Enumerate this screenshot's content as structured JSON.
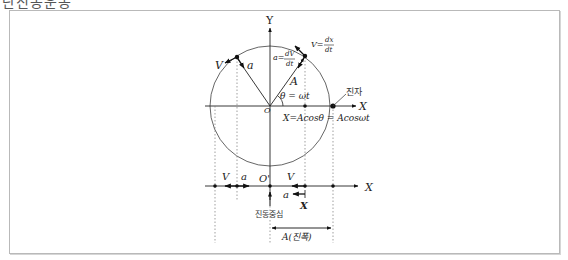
{
  "page": {
    "title_partial": "단진동운동"
  },
  "diagram": {
    "axis_labels": {
      "y": "Y",
      "x_top": "X",
      "x_bottom": "X",
      "origin": "O",
      "origin_bottom": "O'"
    },
    "vector_labels": {
      "velocity_left": "V",
      "accel_left": "a",
      "velocity_right": "V=",
      "velocity_right_num": "dx",
      "velocity_right_den": "dt",
      "accel_right": "a=",
      "accel_right_num": "dV",
      "accel_right_den": "dt",
      "radius": "A",
      "angle": "θ = ωt",
      "projection_formula": "X=Acosθ = Acosωt"
    },
    "bottom_labels": {
      "v_left": "V",
      "a_left": "a",
      "v_right": "V",
      "a_right": "a",
      "x_marker": "X",
      "center_of_oscillation": "진동중심",
      "amplitude": "A(진폭)"
    },
    "pendulum_label": "진자"
  }
}
